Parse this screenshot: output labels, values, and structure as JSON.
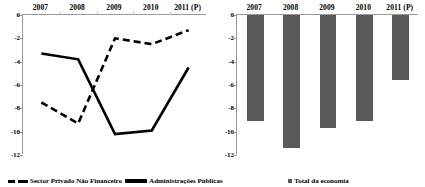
{
  "chart_data": [
    {
      "type": "line",
      "panel": "left",
      "title": "",
      "xlabel": "",
      "ylabel": "",
      "categories": [
        "2007",
        "2008",
        "2009",
        "2010",
        "2011 (P)"
      ],
      "ylim": [
        -12,
        0
      ],
      "yticks": [
        0,
        -2,
        -4,
        -6,
        -8,
        -10,
        -12
      ],
      "ytick_labels": [
        "0",
        "-2",
        "-4",
        "-6",
        "-8",
        "-10",
        "-12"
      ],
      "grid": false,
      "legend_position": "bottom-left",
      "series": [
        {
          "name": "Sector Privado Não Financeiro",
          "style": "dashed",
          "color": "#000000",
          "values": [
            -7.5,
            -9.3,
            -2.0,
            -2.5,
            -1.3
          ]
        },
        {
          "name": "Administrações Públicas",
          "style": "solid",
          "color": "#000000",
          "values": [
            -3.3,
            -3.8,
            -10.2,
            -9.9,
            -4.5
          ]
        }
      ]
    },
    {
      "type": "bar",
      "panel": "right",
      "title": "",
      "xlabel": "",
      "ylabel": "",
      "categories": [
        "2007",
        "2008",
        "2009",
        "2010",
        "2011 (P)"
      ],
      "ylim": [
        -12,
        0
      ],
      "yticks": [
        0,
        -2,
        -4,
        -6,
        -8,
        -10,
        -12
      ],
      "ytick_labels": [
        "0",
        "-2",
        "-4",
        "-6",
        "-8",
        "-10",
        "-12"
      ],
      "grid": false,
      "legend_position": "bottom-center",
      "series": [
        {
          "name": "Total da economia",
          "color": "#595959",
          "values": [
            -9.1,
            -11.4,
            -9.7,
            -9.1,
            -5.6
          ]
        }
      ]
    }
  ],
  "left_panel": {
    "years": [
      "2007",
      "2008",
      "2009",
      "2010",
      "2011 (P)"
    ],
    "ytick_labels": [
      "0",
      "-2",
      "-4",
      "-6",
      "-8",
      "-10",
      "-12"
    ],
    "legend": [
      {
        "label": "Sector Privado Não Financeiro",
        "marker": "dashed-line-swatch"
      },
      {
        "label": "Administrações Públicas",
        "marker": "solid-line-swatch"
      }
    ]
  },
  "right_panel": {
    "years": [
      "2007",
      "2008",
      "2009",
      "2010",
      "2011 (P)"
    ],
    "ytick_labels": [
      "0",
      "-2",
      "-4",
      "-6",
      "-8",
      "-10",
      "-12"
    ],
    "legend": [
      {
        "label": "Total da economia",
        "marker": "square-swatch"
      }
    ]
  },
  "colors": {
    "bar_fill": "#595959",
    "line": "#000000",
    "axis": "#9a9a9a"
  }
}
